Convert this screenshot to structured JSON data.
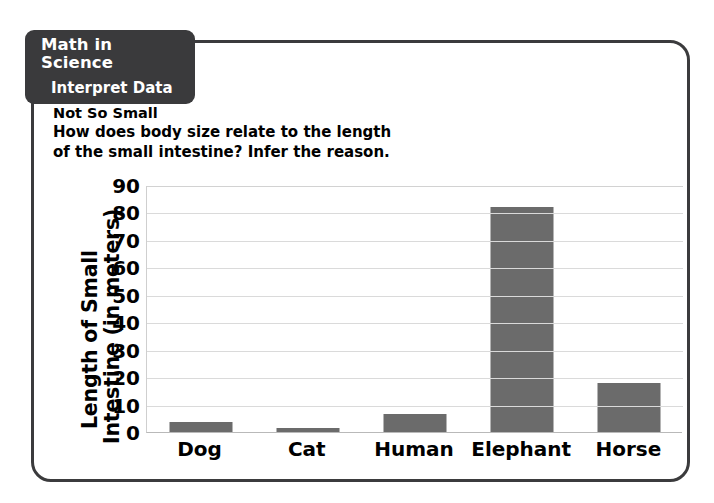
{
  "tab": {
    "title": "Math in Science",
    "subtitle": "Interpret Data"
  },
  "intro": {
    "heading": "Not So Small",
    "line1": "How does body size relate to the length",
    "line2": "of the small intestine? Infer the reason."
  },
  "colors": {
    "bar": "#6b6b6b",
    "panel_border": "#3b3b3d",
    "tab_background": "#3a3a3c",
    "tab_text": "#ffffff",
    "gridline": "#dadada"
  },
  "chart_data": {
    "type": "bar",
    "title": "",
    "xlabel": "",
    "ylabel": "Length of Small Intestine (in meters)",
    "ylabel_line1": "Length of Small",
    "ylabel_line2": "Intestine (in meters)",
    "categories": [
      "Dog",
      "Cat",
      "Human",
      "Elephant",
      "Horse"
    ],
    "values": [
      3.5,
      1.5,
      6.5,
      82,
      18
    ],
    "ylim": [
      0,
      90
    ],
    "yticks": [
      0,
      10,
      20,
      30,
      40,
      50,
      60,
      70,
      80,
      90
    ],
    "ytick_labels": [
      "0",
      "10",
      "20",
      "30",
      "40",
      "50",
      "60",
      "70",
      "80",
      "90"
    ],
    "grid": true,
    "legend": "none",
    "series": [
      {
        "name": "Length of Small Intestine",
        "values": [
          3.5,
          1.5,
          6.5,
          82,
          18
        ]
      }
    ]
  }
}
